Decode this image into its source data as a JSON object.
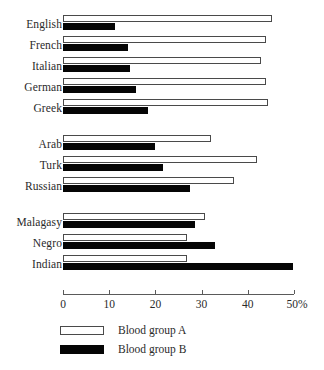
{
  "chart_data": {
    "type": "bar",
    "orientation": "horizontal",
    "title": "",
    "subtitle": "",
    "xlabel": "",
    "ylabel": "",
    "xlim": [
      0,
      50
    ],
    "grid": false,
    "legend_position": "bottom-left",
    "xticks": [
      {
        "value": 0,
        "label": "0"
      },
      {
        "value": 10,
        "label": "10"
      },
      {
        "value": 20,
        "label": "20"
      },
      {
        "value": 30,
        "label": "30"
      },
      {
        "value": 40,
        "label": "40"
      },
      {
        "value": 50,
        "label": "50%"
      }
    ],
    "categories": [
      "English",
      "French",
      "Italian",
      "German",
      "Greek",
      "Arab",
      "Turk",
      "Russian",
      "Malagasy",
      "Negro",
      "Indian"
    ],
    "group_breaks_after": [
      "Greek",
      "Russian"
    ],
    "series": [
      {
        "name": "Blood group A",
        "fill": "#ffffff",
        "stroke": "#4a4a4a",
        "values": [
          45.2,
          43.9,
          42.9,
          43.9,
          44.4,
          32.0,
          42.0,
          37.0,
          30.7,
          26.8,
          26.8
        ]
      },
      {
        "name": "Blood group B",
        "fill": "#050505",
        "stroke": "#050505",
        "values": [
          11.3,
          14.1,
          14.5,
          15.8,
          18.4,
          19.9,
          21.6,
          27.5,
          28.6,
          32.9,
          49.8
        ]
      }
    ]
  },
  "legend": {
    "items": [
      {
        "label": "Blood group A",
        "swatch": "outlined-white"
      },
      {
        "label": "Blood group B",
        "swatch": "solid-black"
      }
    ]
  }
}
